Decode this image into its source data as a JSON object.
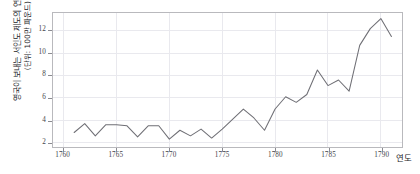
{
  "chart_data": {
    "type": "line",
    "title": "",
    "xlabel": "연도",
    "ylabel": "영국이 보내는 서인도 제도의 연간 출하량",
    "ylabel_unit": "(단위: 100만 파운드)",
    "xlim": [
      1759,
      1792
    ],
    "ylim": [
      1.6,
      13.6
    ],
    "xticks": [
      1760,
      1765,
      1770,
      1775,
      1780,
      1785,
      1790
    ],
    "xticklabels": [
      "1760",
      "1765",
      "1770",
      "1775",
      "1780",
      "1785",
      "1790"
    ],
    "yticks": [
      2,
      4,
      6,
      8,
      10,
      12
    ],
    "yticklabels": [
      "2",
      "4",
      "6",
      "8",
      "10",
      "12"
    ],
    "grid": true,
    "legend": false,
    "line_color": "#6f6f75",
    "grid_color": "#e9e9ee",
    "frame_color": "#b9b9bd",
    "x": [
      1761,
      1762,
      1763,
      1764,
      1765,
      1766,
      1767,
      1768,
      1769,
      1770,
      1771,
      1772,
      1773,
      1774,
      1775,
      1776,
      1777,
      1778,
      1779,
      1780,
      1781,
      1782,
      1783,
      1784,
      1785,
      1786,
      1787,
      1788,
      1789,
      1790,
      1791
    ],
    "values": [
      2.9,
      3.7,
      2.6,
      3.6,
      3.6,
      3.5,
      2.5,
      3.5,
      3.5,
      2.3,
      3.1,
      2.6,
      3.2,
      2.4,
      3.2,
      4.1,
      5.0,
      4.2,
      3.1,
      5.0,
      6.1,
      5.6,
      6.3,
      8.5,
      7.1,
      7.6,
      6.6,
      10.7,
      12.2,
      13.1,
      11.5
    ]
  }
}
